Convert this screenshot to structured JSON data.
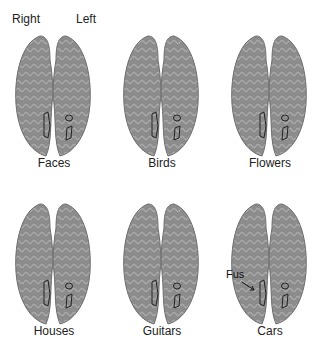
{
  "hemisphere_labels": {
    "right": "Right",
    "left": "Left"
  },
  "panels": [
    {
      "label": "Faces"
    },
    {
      "label": "Birds"
    },
    {
      "label": "Flowers"
    },
    {
      "label": "Houses"
    },
    {
      "label": "Guitars"
    },
    {
      "label": "Cars"
    }
  ],
  "annotation": {
    "fusiform": "Fus"
  },
  "colors": {
    "cortex": "#8c8c8c",
    "sulci": "#a8a8a8",
    "outline": "#222222"
  }
}
